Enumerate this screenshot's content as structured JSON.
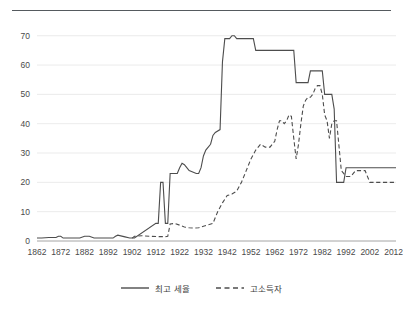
{
  "chart_data": {
    "type": "line",
    "title": "",
    "subtitle": "",
    "xlabel": "",
    "ylabel": "",
    "xlim": [
      1862,
      2013
    ],
    "ylim": [
      0,
      74
    ],
    "yticks": [
      0,
      10,
      20,
      30,
      40,
      50,
      60,
      70
    ],
    "xticks": [
      1862,
      1872,
      1882,
      1892,
      1902,
      1912,
      1922,
      1932,
      1942,
      1952,
      1962,
      1972,
      1982,
      1992,
      2002,
      2012
    ],
    "grid": true,
    "legend_position": "bottom",
    "series": [
      {
        "name": "최고 세율",
        "style": "solid",
        "color": "#4d4d4d",
        "x": [
          1862,
          1864,
          1867,
          1870,
          1871,
          1872,
          1873,
          1876,
          1878,
          1880,
          1882,
          1884,
          1886,
          1890,
          1893,
          1894,
          1895,
          1896,
          1899,
          1901,
          1902,
          1903,
          1912,
          1913,
          1914,
          1915,
          1916,
          1917,
          1918,
          1921,
          1922,
          1923,
          1924,
          1925,
          1926,
          1929,
          1930,
          1931,
          1932,
          1933,
          1935,
          1936,
          1937,
          1939,
          1940,
          1941,
          1942,
          1943,
          1944,
          1945,
          1946,
          1947,
          1950,
          1951,
          1952,
          1953,
          1954,
          1963,
          1964,
          1965,
          1970,
          1971,
          1972,
          1976,
          1977,
          1980,
          1981,
          1982,
          1983,
          1986,
          1987,
          1988,
          1990,
          1991,
          1992,
          1993,
          2002,
          2013
        ],
        "values": [
          1.0,
          1.0,
          1.2,
          1.2,
          1.6,
          1.6,
          1.0,
          1.0,
          1.0,
          1.0,
          1.6,
          1.6,
          1.0,
          1.0,
          1.0,
          1.0,
          1.6,
          2.0,
          1.4,
          1.0,
          1.0,
          1.0,
          6.0,
          6.0,
          20.0,
          20.0,
          6.0,
          6.0,
          23.0,
          23.0,
          25.0,
          26.5,
          26.0,
          25.0,
          24.0,
          23.0,
          23.0,
          25.0,
          29.0,
          31.0,
          33.0,
          36.0,
          37.0,
          38.0,
          61.0,
          69.0,
          69.0,
          69.0,
          70.0,
          70.0,
          69.0,
          69.0,
          69.0,
          69.0,
          69.0,
          69.0,
          65.0,
          65.0,
          65.0,
          65.0,
          65.0,
          54.0,
          54.0,
          54.0,
          58.0,
          58.0,
          58.0,
          58.0,
          50.0,
          50.0,
          45.0,
          20.0,
          20.0,
          20.0,
          25.0,
          25.0,
          25.0,
          25.0
        ]
      },
      {
        "name": "고소득자",
        "style": "dashed",
        "color": "#4d4d4d",
        "x": [
          1902,
          1903,
          1906,
          1910,
          1913,
          1916,
          1917,
          1918,
          1920,
          1922,
          1924,
          1926,
          1928,
          1930,
          1932,
          1934,
          1936,
          1938,
          1940,
          1942,
          1944,
          1946,
          1948,
          1950,
          1952,
          1954,
          1956,
          1958,
          1960,
          1962,
          1963,
          1964,
          1965,
          1966,
          1967,
          1968,
          1969,
          1970,
          1971,
          1972,
          1973,
          1974,
          1975,
          1976,
          1977,
          1978,
          1979,
          1980,
          1981,
          1982,
          1983,
          1984,
          1985,
          1986,
          1987,
          1988,
          1990,
          1992,
          1994,
          1996,
          1998,
          2000,
          2002,
          2013
        ],
        "values": [
          1.0,
          1.6,
          1.8,
          1.6,
          1.5,
          1.5,
          1.6,
          5.8,
          6.0,
          5.4,
          4.8,
          4.5,
          4.4,
          4.5,
          5.0,
          5.5,
          6.0,
          10.0,
          13.0,
          15.5,
          16.0,
          17.0,
          20.0,
          24.0,
          28.0,
          31.0,
          33.0,
          32.0,
          32.0,
          34.0,
          38.0,
          41.0,
          41.0,
          40.0,
          41.0,
          43.0,
          42.5,
          35.0,
          28.0,
          33.0,
          40.0,
          46.0,
          48.0,
          49.0,
          49.0,
          50.0,
          52.0,
          53.0,
          53.0,
          50.0,
          43.0,
          41.0,
          35.0,
          40.0,
          41.0,
          41.0,
          24.0,
          22.0,
          22.0,
          24.0,
          24.0,
          24.0,
          20.0,
          20.0
        ]
      }
    ]
  },
  "legend": {
    "items": [
      {
        "label": "최고 세율",
        "style": "solid"
      },
      {
        "label": "고소득자",
        "style": "dashed"
      }
    ]
  }
}
